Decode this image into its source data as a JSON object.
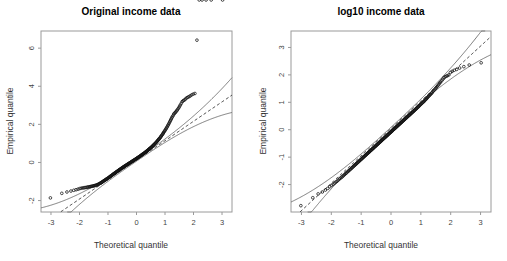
{
  "figure": {
    "width": 507,
    "height": 261,
    "background": "#ffffff",
    "panel_count": 2
  },
  "chart_data": [
    {
      "type": "scatter",
      "title": "Original income data",
      "xlabel": "Theoretical quantile",
      "ylabel": "Empirical quantile",
      "xlim": [
        -3.35,
        3.35
      ],
      "ylim": [
        -2.6,
        6.9
      ],
      "xticks": [
        -3,
        -2,
        -1,
        0,
        1,
        2,
        3
      ],
      "xticklabels": [
        "-3",
        "-2",
        "-1",
        "0",
        "1",
        "2",
        "3"
      ],
      "yticks": [
        -2,
        0,
        2,
        4,
        6
      ],
      "yticklabels": [
        "-2",
        "0",
        "2",
        "4",
        "6"
      ],
      "grid": false,
      "legend": "none",
      "annotations": [
        "dashed line = normal reference line",
        "solid curves = pointwise confidence band",
        "extreme upper outlier near (3.0, 6.4)"
      ],
      "series": [
        {
          "name": "Sample quantiles",
          "marker": "open-circle",
          "x": [
            -3.02,
            -2.62,
            -2.44,
            -2.3,
            -2.2,
            -2.12,
            -2.05,
            -1.99,
            -1.94,
            -1.89,
            -1.85,
            -1.81,
            -1.77,
            -1.73,
            -1.7,
            -1.66,
            -1.63,
            -1.6,
            -1.57,
            -1.54,
            -1.51,
            -1.49,
            -1.46,
            -1.43,
            -1.41,
            -1.38,
            -1.36,
            -1.33,
            -1.31,
            -1.29,
            -1.26,
            -1.24,
            -1.22,
            -1.2,
            -1.18,
            -1.16,
            -1.14,
            -1.12,
            -1.1,
            -1.08,
            -1.06,
            -1.04,
            -1.02,
            -1.0,
            -0.98,
            -0.96,
            -0.94,
            -0.93,
            -0.91,
            -0.89,
            -0.87,
            -0.85,
            -0.84,
            -0.82,
            -0.8,
            -0.78,
            -0.77,
            -0.75,
            -0.73,
            -0.72,
            -0.7,
            -0.68,
            -0.67,
            -0.65,
            -0.63,
            -0.62,
            -0.6,
            -0.59,
            -0.57,
            -0.55,
            -0.54,
            -0.52,
            -0.51,
            -0.49,
            -0.47,
            -0.46,
            -0.44,
            -0.43,
            -0.41,
            -0.4,
            -0.38,
            -0.36,
            -0.35,
            -0.33,
            -0.32,
            -0.3,
            -0.29,
            -0.27,
            -0.26,
            -0.24,
            -0.22,
            -0.21,
            -0.19,
            -0.18,
            -0.16,
            -0.15,
            -0.13,
            -0.12,
            -0.1,
            -0.09,
            -0.07,
            -0.05,
            -0.04,
            -0.02,
            -0.01,
            0.01,
            0.02,
            0.04,
            0.05,
            0.07,
            0.09,
            0.1,
            0.12,
            0.13,
            0.15,
            0.16,
            0.18,
            0.19,
            0.21,
            0.22,
            0.24,
            0.26,
            0.27,
            0.29,
            0.3,
            0.32,
            0.33,
            0.35,
            0.36,
            0.38,
            0.4,
            0.41,
            0.43,
            0.44,
            0.46,
            0.47,
            0.49,
            0.51,
            0.52,
            0.54,
            0.55,
            0.57,
            0.59,
            0.6,
            0.62,
            0.63,
            0.65,
            0.67,
            0.68,
            0.7,
            0.72,
            0.73,
            0.75,
            0.77,
            0.78,
            0.8,
            0.82,
            0.84,
            0.85,
            0.87,
            0.89,
            0.91,
            0.93,
            0.94,
            0.96,
            0.98,
            1.0,
            1.02,
            1.04,
            1.06,
            1.08,
            1.1,
            1.12,
            1.14,
            1.16,
            1.18,
            1.2,
            1.22,
            1.24,
            1.26,
            1.29,
            1.31,
            1.33,
            1.36,
            1.38,
            1.41,
            1.43,
            1.46,
            1.49,
            1.51,
            1.54,
            1.57,
            1.6,
            1.63,
            1.66,
            1.7,
            1.73,
            1.77,
            1.81,
            1.85,
            1.89,
            1.94,
            1.99,
            2.05,
            2.12,
            2.2,
            2.3,
            2.44,
            2.62,
            3.02
          ],
          "y": [
            -1.86,
            -1.62,
            -1.55,
            -1.5,
            -1.46,
            -1.43,
            -1.4,
            -1.37,
            -1.35,
            -1.34,
            -1.33,
            -1.32,
            -1.31,
            -1.3,
            -1.29,
            -1.28,
            -1.27,
            -1.26,
            -1.25,
            -1.24,
            -1.23,
            -1.22,
            -1.21,
            -1.2,
            -1.19,
            -1.17,
            -1.16,
            -1.14,
            -1.12,
            -1.1,
            -1.08,
            -1.06,
            -1.04,
            -1.02,
            -1.0,
            -0.98,
            -0.96,
            -0.94,
            -0.92,
            -0.9,
            -0.88,
            -0.86,
            -0.84,
            -0.82,
            -0.8,
            -0.78,
            -0.76,
            -0.74,
            -0.72,
            -0.7,
            -0.68,
            -0.66,
            -0.64,
            -0.62,
            -0.6,
            -0.58,
            -0.56,
            -0.55,
            -0.53,
            -0.51,
            -0.49,
            -0.47,
            -0.46,
            -0.44,
            -0.42,
            -0.4,
            -0.39,
            -0.37,
            -0.35,
            -0.34,
            -0.32,
            -0.3,
            -0.29,
            -0.27,
            -0.25,
            -0.24,
            -0.22,
            -0.21,
            -0.19,
            -0.18,
            -0.16,
            -0.15,
            -0.13,
            -0.12,
            -0.1,
            -0.09,
            -0.07,
            -0.06,
            -0.04,
            -0.03,
            -0.01,
            0.0,
            0.02,
            0.03,
            0.05,
            0.06,
            0.08,
            0.09,
            0.11,
            0.12,
            0.14,
            0.15,
            0.17,
            0.18,
            0.2,
            0.21,
            0.23,
            0.24,
            0.26,
            0.28,
            0.29,
            0.31,
            0.32,
            0.34,
            0.36,
            0.37,
            0.39,
            0.41,
            0.42,
            0.44,
            0.46,
            0.47,
            0.49,
            0.51,
            0.53,
            0.54,
            0.56,
            0.58,
            0.6,
            0.62,
            0.64,
            0.66,
            0.68,
            0.7,
            0.72,
            0.74,
            0.76,
            0.78,
            0.8,
            0.82,
            0.85,
            0.87,
            0.89,
            0.92,
            0.94,
            0.97,
            0.99,
            1.02,
            1.04,
            1.07,
            1.1,
            1.13,
            1.16,
            1.19,
            1.22,
            1.25,
            1.28,
            1.32,
            1.35,
            1.39,
            1.43,
            1.47,
            1.51,
            1.55,
            1.59,
            1.64,
            1.68,
            1.73,
            1.78,
            1.83,
            1.88,
            1.94,
            1.99,
            2.05,
            2.11,
            2.17,
            2.23,
            2.29,
            2.35,
            2.41,
            2.47,
            2.54,
            2.58,
            2.62,
            2.66,
            2.71,
            2.76,
            2.82,
            2.88,
            2.95,
            3.02,
            3.1,
            3.19,
            3.23,
            3.26,
            3.3,
            3.35,
            3.4,
            3.43,
            3.46,
            3.5,
            3.55,
            3.59,
            3.62,
            6.42
          ]
        }
      ],
      "reference_line": {
        "style": "dashed",
        "slope": 1.02,
        "intercept": 0.12
      },
      "confidence_band": {
        "style": "solid",
        "curves": 2
      }
    },
    {
      "type": "scatter",
      "title": "log10 income data",
      "xlabel": "Theoretical quantile",
      "ylabel": "Empirical quantile",
      "xlim": [
        -3.35,
        3.35
      ],
      "ylim": [
        -3.0,
        3.6
      ],
      "xticks": [
        -3,
        -2,
        -1,
        0,
        1,
        2,
        3
      ],
      "xticklabels": [
        "-3",
        "-2",
        "-1",
        "0",
        "1",
        "2",
        "3"
      ],
      "yticks": [
        -2,
        -1,
        0,
        1,
        2,
        3
      ],
      "yticklabels": [
        "-2",
        "-1",
        "0",
        "1",
        "2",
        "3"
      ],
      "grid": false,
      "legend": "none",
      "annotations": [
        "dashed line = normal reference line",
        "solid curves = pointwise confidence band",
        "points track the reference line closely"
      ],
      "series": [
        {
          "name": "Sample quantiles",
          "marker": "open-circle",
          "x": [
            -3.02,
            -2.62,
            -2.44,
            -2.3,
            -2.2,
            -2.12,
            -2.05,
            -1.99,
            -1.94,
            -1.89,
            -1.85,
            -1.81,
            -1.77,
            -1.73,
            -1.7,
            -1.66,
            -1.63,
            -1.6,
            -1.57,
            -1.54,
            -1.51,
            -1.49,
            -1.46,
            -1.43,
            -1.41,
            -1.38,
            -1.36,
            -1.33,
            -1.31,
            -1.29,
            -1.26,
            -1.24,
            -1.22,
            -1.2,
            -1.18,
            -1.16,
            -1.14,
            -1.12,
            -1.1,
            -1.08,
            -1.06,
            -1.04,
            -1.02,
            -1.0,
            -0.98,
            -0.96,
            -0.94,
            -0.93,
            -0.91,
            -0.89,
            -0.87,
            -0.85,
            -0.84,
            -0.82,
            -0.8,
            -0.78,
            -0.77,
            -0.75,
            -0.73,
            -0.72,
            -0.7,
            -0.68,
            -0.67,
            -0.65,
            -0.63,
            -0.62,
            -0.6,
            -0.59,
            -0.57,
            -0.55,
            -0.54,
            -0.52,
            -0.51,
            -0.49,
            -0.47,
            -0.46,
            -0.44,
            -0.43,
            -0.41,
            -0.4,
            -0.38,
            -0.36,
            -0.35,
            -0.33,
            -0.32,
            -0.3,
            -0.29,
            -0.27,
            -0.26,
            -0.24,
            -0.22,
            -0.21,
            -0.19,
            -0.18,
            -0.16,
            -0.15,
            -0.13,
            -0.12,
            -0.1,
            -0.09,
            -0.07,
            -0.05,
            -0.04,
            -0.02,
            -0.01,
            0.01,
            0.02,
            0.04,
            0.05,
            0.07,
            0.09,
            0.1,
            0.12,
            0.13,
            0.15,
            0.16,
            0.18,
            0.19,
            0.21,
            0.22,
            0.24,
            0.26,
            0.27,
            0.29,
            0.3,
            0.32,
            0.33,
            0.35,
            0.36,
            0.38,
            0.4,
            0.41,
            0.43,
            0.44,
            0.46,
            0.47,
            0.49,
            0.51,
            0.52,
            0.54,
            0.55,
            0.57,
            0.59,
            0.6,
            0.62,
            0.63,
            0.65,
            0.67,
            0.68,
            0.7,
            0.72,
            0.73,
            0.75,
            0.77,
            0.78,
            0.8,
            0.82,
            0.84,
            0.85,
            0.87,
            0.89,
            0.91,
            0.93,
            0.94,
            0.96,
            0.98,
            1.0,
            1.02,
            1.04,
            1.06,
            1.08,
            1.1,
            1.12,
            1.14,
            1.16,
            1.18,
            1.2,
            1.22,
            1.24,
            1.26,
            1.29,
            1.31,
            1.33,
            1.36,
            1.38,
            1.41,
            1.43,
            1.46,
            1.49,
            1.51,
            1.54,
            1.57,
            1.6,
            1.63,
            1.66,
            1.7,
            1.73,
            1.77,
            1.81,
            1.85,
            1.89,
            1.94,
            1.99,
            2.05,
            2.12,
            2.2,
            2.3,
            2.44,
            2.62,
            3.02
          ],
          "y": [
            -2.77,
            -2.48,
            -2.34,
            -2.27,
            -2.2,
            -2.14,
            -2.08,
            -2.03,
            -1.99,
            -1.95,
            -1.91,
            -1.88,
            -1.84,
            -1.8,
            -1.77,
            -1.74,
            -1.71,
            -1.68,
            -1.65,
            -1.62,
            -1.59,
            -1.57,
            -1.54,
            -1.51,
            -1.49,
            -1.46,
            -1.44,
            -1.41,
            -1.39,
            -1.37,
            -1.34,
            -1.32,
            -1.3,
            -1.28,
            -1.26,
            -1.24,
            -1.22,
            -1.2,
            -1.18,
            -1.16,
            -1.14,
            -1.12,
            -1.1,
            -1.08,
            -1.06,
            -1.04,
            -1.02,
            -1.0,
            -0.99,
            -0.97,
            -0.95,
            -0.93,
            -0.92,
            -0.9,
            -0.88,
            -0.86,
            -0.85,
            -0.83,
            -0.81,
            -0.8,
            -0.78,
            -0.76,
            -0.75,
            -0.73,
            -0.71,
            -0.7,
            -0.68,
            -0.67,
            -0.65,
            -0.63,
            -0.62,
            -0.6,
            -0.59,
            -0.57,
            -0.55,
            -0.54,
            -0.52,
            -0.51,
            -0.49,
            -0.48,
            -0.46,
            -0.44,
            -0.43,
            -0.41,
            -0.4,
            -0.38,
            -0.37,
            -0.35,
            -0.34,
            -0.32,
            -0.3,
            -0.29,
            -0.27,
            -0.26,
            -0.24,
            -0.23,
            -0.21,
            -0.2,
            -0.18,
            -0.17,
            -0.15,
            -0.13,
            -0.12,
            -0.1,
            -0.09,
            -0.07,
            -0.06,
            -0.04,
            -0.03,
            -0.01,
            0.01,
            0.02,
            0.04,
            0.05,
            0.07,
            0.08,
            0.1,
            0.11,
            0.13,
            0.14,
            0.16,
            0.18,
            0.19,
            0.21,
            0.22,
            0.24,
            0.25,
            0.27,
            0.28,
            0.3,
            0.32,
            0.33,
            0.35,
            0.36,
            0.38,
            0.39,
            0.41,
            0.43,
            0.44,
            0.46,
            0.47,
            0.49,
            0.51,
            0.52,
            0.54,
            0.55,
            0.57,
            0.59,
            0.6,
            0.62,
            0.64,
            0.65,
            0.67,
            0.69,
            0.7,
            0.72,
            0.74,
            0.76,
            0.77,
            0.79,
            0.81,
            0.83,
            0.85,
            0.87,
            0.89,
            0.91,
            0.93,
            0.95,
            0.97,
            0.99,
            1.01,
            1.03,
            1.05,
            1.08,
            1.1,
            1.12,
            1.15,
            1.17,
            1.2,
            1.22,
            1.25,
            1.28,
            1.3,
            1.33,
            1.36,
            1.4,
            1.43,
            1.46,
            1.5,
            1.53,
            1.57,
            1.61,
            1.65,
            1.7,
            1.74,
            1.79,
            1.84,
            1.9,
            1.93,
            1.95,
            1.97,
            2.0,
            2.09,
            2.13,
            2.17,
            2.2,
            2.25,
            2.3,
            2.36,
            2.44,
            3.26
          ]
        }
      ],
      "reference_line": {
        "style": "dashed",
        "slope": 1.0,
        "intercept": 0.05
      },
      "confidence_band": {
        "style": "solid",
        "curves": 2
      }
    }
  ]
}
